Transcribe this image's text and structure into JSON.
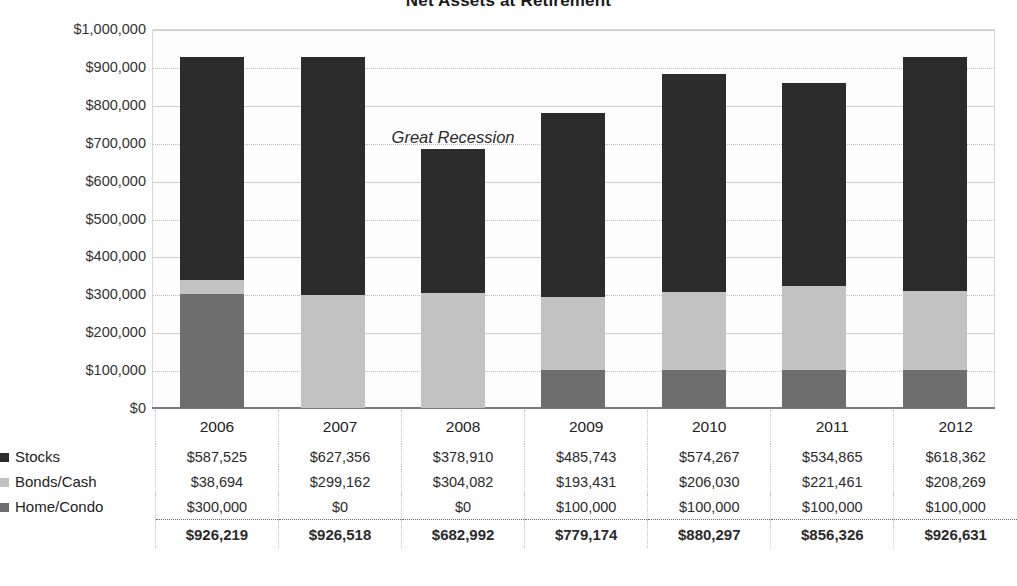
{
  "chart_data": {
    "type": "bar",
    "title": "Net Assets at Retirement",
    "xlabel": "",
    "ylabel": "",
    "ylim": [
      0,
      1000000
    ],
    "ytick_step": 100000,
    "grid": true,
    "stacked": true,
    "legend_position": "left-below-plot",
    "categories": [
      "2006",
      "2007",
      "2008",
      "2009",
      "2010",
      "2011",
      "2012"
    ],
    "series": [
      {
        "name": "Stocks",
        "color": "#2c2c2c",
        "values": [
          587525,
          627356,
          378910,
          485743,
          574267,
          534865,
          618362
        ],
        "labels": [
          "$587,525",
          "$627,356",
          "$378,910",
          "$485,743",
          "$574,267",
          "$534,865",
          "$618,362"
        ]
      },
      {
        "name": "Bonds/Cash",
        "color": "#c2c2c2",
        "values": [
          38694,
          299162,
          304082,
          193431,
          206030,
          221461,
          208269
        ],
        "labels": [
          "$38,694",
          "$299,162",
          "$304,082",
          "$193,431",
          "$206,030",
          "$221,461",
          "$208,269"
        ]
      },
      {
        "name": "Home/Condo",
        "color": "#6e6e6e",
        "values": [
          300000,
          0,
          0,
          100000,
          100000,
          100000,
          100000
        ],
        "labels": [
          "$300,000",
          "$0",
          "$0",
          "$100,000",
          "$100,000",
          "$100,000",
          "$100,000"
        ]
      }
    ],
    "totals": [
      926219,
      926518,
      682992,
      779174,
      880297,
      856326,
      926631
    ],
    "total_labels": [
      "$926,219",
      "$926,518",
      "$682,992",
      "$779,174",
      "$880,297",
      "$856,326",
      "$926,631"
    ],
    "ytick_labels": [
      "$0",
      "$100,000",
      "$200,000",
      "$300,000",
      "$400,000",
      "$500,000",
      "$600,000",
      "$700,000",
      "$800,000",
      "$900,000",
      "$1,000,000"
    ],
    "ytick_values": [
      0,
      100000,
      200000,
      300000,
      400000,
      500000,
      600000,
      700000,
      800000,
      900000,
      1000000
    ],
    "annotations": [
      {
        "text": "Great Recession",
        "x_category": "2008",
        "y_value": 715000,
        "style": "italic"
      }
    ]
  },
  "legend": {
    "items": [
      {
        "label": "Stocks",
        "swatch": "#2c2c2c"
      },
      {
        "label": "Bonds/Cash",
        "swatch": "#c2c2c2"
      },
      {
        "label": "Home/Condo",
        "swatch": "#6e6e6e"
      }
    ]
  }
}
